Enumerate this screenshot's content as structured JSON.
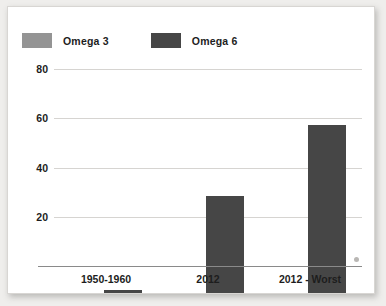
{
  "chart_data": {
    "type": "bar",
    "title": "",
    "subtitle": "",
    "xlabel": "",
    "ylabel": "",
    "categories": [
      "1950-1960",
      "2012",
      "2012 - Worst"
    ],
    "series": [
      {
        "name": "Omega 3",
        "color": "#949494",
        "values": [
          1,
          1,
          1
        ]
      },
      {
        "name": "Omega 6",
        "color": "#464646",
        "values": [
          2,
          40,
          69
        ]
      }
    ],
    "ylim": [
      0,
      80
    ],
    "yticks": [
      20,
      40,
      60,
      80
    ],
    "ytick_labels": [
      "20",
      "40",
      "60",
      "80"
    ],
    "grid": true,
    "legend_position": "top-left",
    "annotations": []
  },
  "legend": {
    "entries": [
      {
        "label": "Omega 3",
        "swatch_color": "#949494"
      },
      {
        "label": "Omega 6",
        "swatch_color": "#464646"
      }
    ]
  },
  "axes": {
    "y_ticks": [
      "80",
      "60",
      "40",
      "20"
    ],
    "x_ticks": [
      "1950-1960",
      "2012",
      "2012 - Worst"
    ]
  },
  "colors": {
    "omega3": "#949494",
    "omega6": "#464646",
    "gridline": "#d6d4d1",
    "axis": "#8a8a8a",
    "text": "#1d1d1d",
    "card_background": "#ffffff",
    "page_background": "#efeeec"
  }
}
